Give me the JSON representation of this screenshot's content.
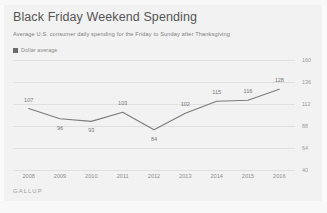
{
  "chart": {
    "title": "Black Friday Weekend Spending",
    "subtitle": "Average U.S. consumer daily spending for the Friday to Sunday after Thanksgiving",
    "source": "GALLUP",
    "legend": {
      "label": "Dollar average",
      "swatch_color": "#6b6b6b",
      "position": "top-left"
    },
    "colors": {
      "line": "#7b7b7b",
      "grid": "#e0e0e0",
      "card_background": "#f2f2f2",
      "title_text": "#555555",
      "label_text": "#7a7a7a"
    }
  },
  "chart_data": {
    "type": "line",
    "title": "Black Friday Weekend Spending",
    "subtitle": "Average U.S. consumer daily spending for the Friday to Sunday after Thanksgiving",
    "xlabel": "",
    "ylabel": "",
    "categories": [
      "2008",
      "2009",
      "2010",
      "2011",
      "2012",
      "2013",
      "2014",
      "2015",
      "2016"
    ],
    "series": [
      {
        "name": "Dollar average",
        "values": [
          107,
          96,
          93,
          103,
          84,
          102,
          115,
          116,
          128
        ]
      }
    ],
    "point_labels": [
      "107",
      "96",
      "93",
      "103",
      "84",
      "102",
      "115",
      "116",
      "128"
    ],
    "ylim": [
      40,
      160
    ],
    "yticks": [
      160,
      136,
      112,
      88,
      64,
      40
    ],
    "ytick_labels": [
      "160",
      "136",
      "112",
      "88",
      "64",
      "40"
    ],
    "xticks": [
      "2008",
      "2009",
      "2010",
      "2011",
      "2012",
      "2013",
      "2014",
      "2015",
      "2016"
    ],
    "grid": true,
    "legend_position": "top-left",
    "annotations": [
      "GALLUP"
    ]
  }
}
